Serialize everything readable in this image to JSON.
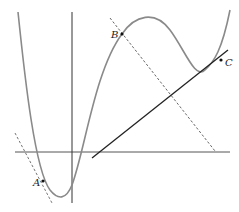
{
  "diagram": {
    "type": "function-graph-with-tangents",
    "axes": {
      "x_axis": {
        "x1": 15,
        "y1": 152,
        "x2": 230,
        "y2": 152
      },
      "y_axis": {
        "x1": 72,
        "y1": 12,
        "x2": 72,
        "y2": 203
      }
    },
    "points": [
      {
        "label": "A",
        "x": 43,
        "y": 181,
        "label_x": 33,
        "label_y": 186
      },
      {
        "label": "B",
        "x": 122,
        "y": 34,
        "label_x": 111,
        "label_y": 38
      },
      {
        "label": "C",
        "x": 221,
        "y": 60,
        "label_x": 225,
        "label_y": 66
      }
    ],
    "lines": {
      "tangent_A": {
        "style": "dashed",
        "x1": 15,
        "y1": 133,
        "x2": 52,
        "y2": 203
      },
      "tangent_B": {
        "style": "dashed",
        "x1": 110,
        "y1": 18,
        "x2": 215,
        "y2": 151
      },
      "secant_C": {
        "style": "solid",
        "x1": 92,
        "y1": 158,
        "x2": 228,
        "y2": 50
      }
    },
    "colors": {
      "curve": "#8a8a8a",
      "axes": "#333333",
      "secant": "#222222",
      "dashed": "#555555"
    }
  }
}
